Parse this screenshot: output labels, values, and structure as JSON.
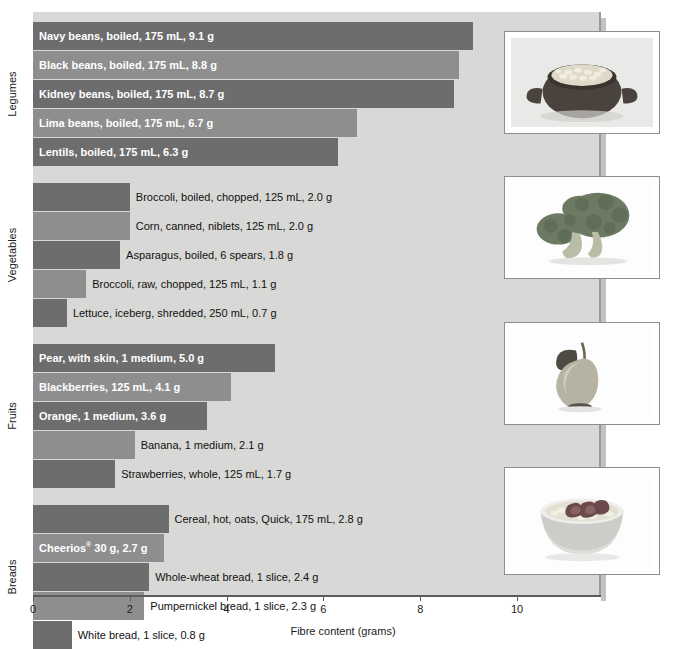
{
  "chart_data": {
    "type": "bar",
    "orientation": "horizontal",
    "title": "",
    "xlabel": "Fibre content (grams)",
    "ylabel": "",
    "xlim": [
      0,
      11.73
    ],
    "xticks": [
      0,
      2,
      4,
      6,
      8,
      10
    ],
    "xticklabels": [
      "0",
      "2",
      "4",
      "6",
      "8",
      "10"
    ],
    "grid": false,
    "legend": "none",
    "groups": [
      {
        "name": "Legumes",
        "categories": [
          "Navy beans, boiled, 175 mL, 9.1 g",
          "Black beans, boiled, 175 mL, 8.8 g",
          "Kidney beans, boiled, 175 mL, 8.7 g",
          "Lima beans, boiled, 175 mL, 6.7 g",
          "Lentils, boiled, 175 mL, 6.3 g"
        ],
        "values": [
          9.1,
          8.8,
          8.7,
          6.7,
          6.3
        ],
        "label_inside": [
          true,
          true,
          true,
          true,
          true
        ]
      },
      {
        "name": "Vegetables",
        "categories": [
          "Broccoli, boiled, chopped, 125 mL, 2.0 g",
          "Corn, canned, niblets, 125 mL, 2.0 g",
          "Asparagus, boiled, 6 spears, 1.8 g",
          "Broccoli, raw, chopped, 125 mL, 1.1 g",
          "Lettuce, iceberg, shredded, 250 mL, 0.7 g"
        ],
        "values": [
          2.0,
          2.0,
          1.8,
          1.1,
          0.7
        ],
        "label_inside": [
          false,
          false,
          false,
          false,
          false
        ]
      },
      {
        "name": "Fruits",
        "categories": [
          "Pear, with skin, 1 medium, 5.0 g",
          "Blackberries, 125 mL, 4.1 g",
          "Orange, 1 medium, 3.6 g",
          "Banana, 1 medium, 2.1 g",
          "Strawberries, whole, 125 mL, 1.7 g"
        ],
        "values": [
          5.0,
          4.1,
          3.6,
          2.1,
          1.7
        ],
        "label_inside": [
          true,
          true,
          true,
          false,
          false
        ]
      },
      {
        "name": "Breads",
        "categories": [
          "Cereal, hot, oats, Quick, 175 mL, 2.8 g",
          "Cheerios® 30 g, 2.7 g",
          "Whole-wheat bread, 1 slice, 2.4 g",
          "Pumpernickel bread, 1 slice, 2.3 g",
          "White bread, 1 slice, 0.8 g"
        ],
        "values": [
          2.8,
          2.7,
          2.4,
          2.3,
          0.8
        ],
        "label_inside": [
          false,
          true,
          false,
          false,
          false
        ]
      }
    ],
    "colors": {
      "bar_dark": "#6d6d6d",
      "bar_mid": "#8e8e8e",
      "panel_background": "#d8d8d6",
      "axis": "#5c5c5c",
      "text": "#1b1b1b",
      "inside_text": "#ffffff"
    }
  },
  "photos": [
    {
      "caption_group": "Legumes",
      "alt": "bowl-of-beans-photo"
    },
    {
      "caption_group": "Vegetables",
      "alt": "broccoli-photo"
    },
    {
      "caption_group": "Fruits",
      "alt": "pear-photo"
    },
    {
      "caption_group": "Breads",
      "alt": "bowl-of-cereal-with-strawberries-photo"
    }
  ],
  "axis": {
    "title": "Fibre content (grams)"
  }
}
